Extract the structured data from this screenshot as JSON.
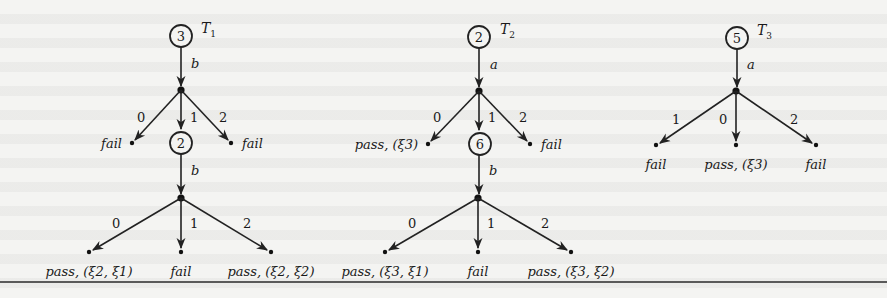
{
  "figure": {
    "rule_color": "#2a2a2a"
  },
  "trees": [
    {
      "name": "T",
      "subscript": "1",
      "root_state": "3",
      "root_action": "b",
      "branches": [
        {
          "output": "0",
          "verdict": "fail"
        },
        {
          "output": "1",
          "next_state": "2",
          "next_action": "b",
          "branches": [
            {
              "output": "0",
              "verdict": "pass, (ξ2, ξ1)"
            },
            {
              "output": "1",
              "verdict": "fail"
            },
            {
              "output": "2",
              "verdict": "pass, (ξ2, ξ2)"
            }
          ]
        },
        {
          "output": "2",
          "verdict": "fail"
        }
      ]
    },
    {
      "name": "T",
      "subscript": "2",
      "root_state": "2",
      "root_action": "a",
      "branches": [
        {
          "output": "0",
          "verdict": "pass, (ξ3)"
        },
        {
          "output": "1",
          "next_state": "6",
          "next_action": "b",
          "branches": [
            {
              "output": "0",
              "verdict": "pass, (ξ3, ξ1)"
            },
            {
              "output": "1",
              "verdict": "fail"
            },
            {
              "output": "2",
              "verdict": "pass, (ξ3, ξ2)"
            }
          ]
        },
        {
          "output": "2",
          "verdict": "fail"
        }
      ]
    },
    {
      "name": "T",
      "subscript": "3",
      "root_state": "5",
      "root_action": "a",
      "branches": [
        {
          "output": "1",
          "verdict": "fail"
        },
        {
          "output": "0",
          "verdict": "pass, (ξ3)"
        },
        {
          "output": "2",
          "verdict": "fail"
        }
      ]
    }
  ]
}
